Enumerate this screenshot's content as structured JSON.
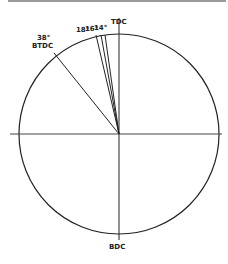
{
  "diagram": {
    "center": {
      "x": 119,
      "y": 134
    },
    "radius": 100,
    "stroke_color": "#222222",
    "labels": {
      "top": "TDC",
      "bottom": "BDC",
      "btdc_angle": "38°",
      "btdc_text": "BTDC",
      "line_a": "18°",
      "line_b": "16°",
      "line_c": "14°"
    },
    "timing_lines_deg_btdc": [
      38,
      18,
      16,
      14
    ]
  }
}
